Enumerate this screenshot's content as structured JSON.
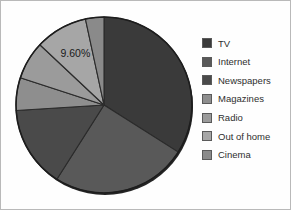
{
  "chart_data": {
    "type": "pie",
    "title": "",
    "subtitle": "",
    "xlabel": "",
    "ylabel": "",
    "grid": false,
    "legend_position": "right",
    "start_angle_deg": 0,
    "direction": "clockwise",
    "categories": [
      "TV",
      "Internet",
      "Newspapers",
      "Magazines",
      "Radio",
      "Out of home",
      "Cinema"
    ],
    "values": [
      34.0,
      25.0,
      15.0,
      6.0,
      7.0,
      9.6,
      3.4
    ],
    "value_unit": "%",
    "slices": [
      {
        "label": "TV",
        "value": 34.0,
        "color": "#3a3a3a",
        "start_deg": 0.0,
        "end_deg": 122.4,
        "data_label": ""
      },
      {
        "label": "Internet",
        "value": 25.0,
        "color": "#595959",
        "start_deg": 122.4,
        "end_deg": 212.4,
        "data_label": ""
      },
      {
        "label": "Newspapers",
        "value": 15.0,
        "color": "#4a4a4a",
        "start_deg": 212.4,
        "end_deg": 266.4,
        "data_label": ""
      },
      {
        "label": "Magazines",
        "value": 6.0,
        "color": "#8e8e8e",
        "start_deg": 266.4,
        "end_deg": 288.0,
        "data_label": ""
      },
      {
        "label": "Radio",
        "value": 7.0,
        "color": "#9b9b9b",
        "start_deg": 288.0,
        "end_deg": 313.2,
        "data_label": ""
      },
      {
        "label": "Out of home",
        "value": 9.6,
        "color": "#a6a6a6",
        "start_deg": 313.2,
        "end_deg": 347.8,
        "data_label": "9.60%"
      },
      {
        "label": "Cinema",
        "value": 3.4,
        "color": "#8a8a8a",
        "start_deg": 347.8,
        "end_deg": 360.0,
        "data_label": ""
      }
    ],
    "annotations": [
      {
        "text": "9.60%",
        "for_slice": "Out of home"
      }
    ]
  },
  "legend": {
    "items": [
      {
        "label": "TV",
        "color": "#3a3a3a"
      },
      {
        "label": "Internet",
        "color": "#595959"
      },
      {
        "label": "Newspapers",
        "color": "#4a4a4a"
      },
      {
        "label": "Magazines",
        "color": "#8e8e8e"
      },
      {
        "label": "Radio",
        "color": "#9b9b9b"
      },
      {
        "label": "Out of home",
        "color": "#a6a6a6"
      },
      {
        "label": "Cinema",
        "color": "#8a8a8a"
      }
    ]
  },
  "label_text": "9.60%"
}
